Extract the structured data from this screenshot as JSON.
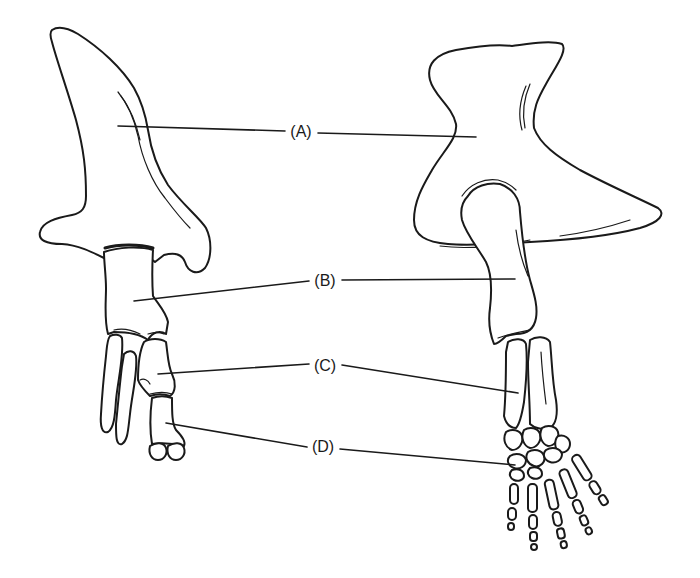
{
  "figure": {
    "line_color": "#1a1a1a",
    "background": "#ffffff"
  },
  "labels": [
    {
      "id": "A",
      "text": "(A)",
      "x": 301,
      "y": 132
    },
    {
      "id": "B",
      "text": "(B)",
      "x": 325,
      "y": 281
    },
    {
      "id": "C",
      "text": "(C)",
      "x": 325,
      "y": 366
    },
    {
      "id": "D",
      "text": "(D)",
      "x": 323,
      "y": 447
    }
  ],
  "leaders": {
    "A": {
      "left": [
        118,
        126,
        285,
        131
      ],
      "right": [
        318,
        133,
        476,
        137
      ]
    },
    "B": {
      "left": [
        134,
        301,
        309,
        281
      ],
      "right": [
        342,
        280,
        515,
        279
      ]
    },
    "C": {
      "left": [
        158,
        374,
        309,
        364
      ],
      "right": [
        342,
        365,
        518,
        393
      ]
    },
    "D": {
      "left": [
        166,
        423,
        307,
        447
      ],
      "right": [
        340,
        449,
        515,
        465
      ]
    }
  },
  "specimens": [
    {
      "name": "left-limb",
      "position": "left"
    },
    {
      "name": "right-limb",
      "position": "right"
    }
  ]
}
